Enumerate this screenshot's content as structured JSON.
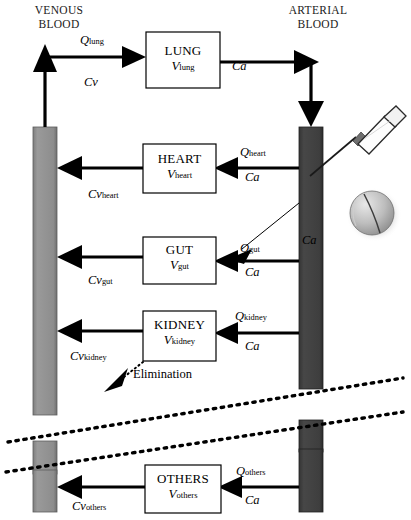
{
  "diagram": {
    "headers": {
      "venous": "VENOUS\nBLOOD",
      "arterial": "ARTERIAL\nBLOOD"
    },
    "colors": {
      "venous_column": "#8c8c8c",
      "arterial_column": "#3f3f3f",
      "line": "#000000",
      "box_fill": "#ffffff",
      "box_stroke": "#000000",
      "pill_light": "#d9d9d9",
      "pill_dark": "#8f8f8f",
      "syringe_barrel": "#ffffff"
    },
    "compartments": [
      {
        "id": "lung",
        "name": "LUNG",
        "volume_sym": "V",
        "volume_sub": "lung"
      },
      {
        "id": "heart",
        "name": "HEART",
        "volume_sym": "V",
        "volume_sub": "heart"
      },
      {
        "id": "gut",
        "name": "GUT",
        "volume_sym": "V",
        "volume_sub": "gut"
      },
      {
        "id": "kidney",
        "name": "KIDNEY",
        "volume_sym": "V",
        "volume_sub": "kidney"
      },
      {
        "id": "others",
        "name": "OTHERS",
        "volume_sym": "V",
        "volume_sub": "others"
      }
    ],
    "flow_labels": {
      "q_lung": {
        "sym": "Q",
        "sub": "lung"
      },
      "q_heart": {
        "sym": "Q",
        "sub": "heart"
      },
      "q_gut": {
        "sym": "Q",
        "sub": "gut"
      },
      "q_kidney": {
        "sym": "Q",
        "sub": "kidney"
      },
      "q_others": {
        "sym": "Q",
        "sub": "others"
      }
    },
    "conc_labels": {
      "cv": {
        "sym": "Cv",
        "sub": ""
      },
      "cv_heart": {
        "sym": "Cv",
        "sub": "heart"
      },
      "cv_gut": {
        "sym": "Cv",
        "sub": "gut"
      },
      "cv_kidney": {
        "sym": "Cv",
        "sub": "kidney"
      },
      "cv_others": {
        "sym": "Cv",
        "sub": "others"
      },
      "ca_lung": "Ca",
      "ca_heart": "Ca",
      "ca_gut": "Ca",
      "ca_kidney": "Ca",
      "ca_others": "Ca",
      "ca_column": "Ca"
    },
    "annotations": {
      "elimination": "Elimination"
    },
    "icons": {
      "syringe": "syringe-icon",
      "pill": "pill-icon",
      "break_line": "axis-break-icon"
    }
  }
}
